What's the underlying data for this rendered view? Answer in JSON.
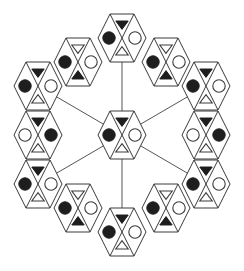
{
  "diagram": {
    "colors": {
      "line": "#3a3a3a",
      "filled": "#1e1e1e",
      "hollow_fill": "#ffffff",
      "background": "#ffffff"
    },
    "hex_size": {
      "half_width": 24,
      "half_top": 12,
      "half_height": 24
    },
    "center": {
      "id": "center",
      "cx": 122,
      "cy": 135,
      "top": "tri-down-filled",
      "left": "circle-filled",
      "right": "circle-hollow",
      "bottom": "tri-up-hollow"
    },
    "ring": [
      {
        "id": "top",
        "cx": 122,
        "cy": 38,
        "top": "tri-down-filled",
        "left": "circle-filled",
        "right": "circle-hollow",
        "bottom": "tri-up-hollow",
        "spoke": true
      },
      {
        "id": "upper-right-diag",
        "cx": 166,
        "cy": 62,
        "top": "tri-down-hollow",
        "left": "circle-filled",
        "right": "circle-hollow",
        "bottom": "tri-up-filled",
        "spoke": false
      },
      {
        "id": "right-upper",
        "cx": 206,
        "cy": 86,
        "top": "tri-down-filled",
        "left": "circle-filled",
        "right": "circle-hollow",
        "bottom": "tri-up-hollow",
        "spoke": true
      },
      {
        "id": "right-mid",
        "cx": 206,
        "cy": 135,
        "top": "tri-down-filled",
        "left": "circle-hollow",
        "right": "circle-filled",
        "bottom": "tri-up-hollow",
        "spoke": false
      },
      {
        "id": "right-lower",
        "cx": 206,
        "cy": 184,
        "top": "tri-down-filled",
        "left": "circle-filled",
        "right": "circle-hollow",
        "bottom": "tri-up-hollow",
        "spoke": true
      },
      {
        "id": "lower-right-diag",
        "cx": 166,
        "cy": 208,
        "top": "tri-down-hollow",
        "left": "circle-filled",
        "right": "circle-hollow",
        "bottom": "tri-up-filled",
        "spoke": false
      },
      {
        "id": "bottom",
        "cx": 122,
        "cy": 232,
        "top": "tri-down-filled",
        "left": "circle-filled",
        "right": "circle-hollow",
        "bottom": "tri-up-hollow",
        "spoke": true
      },
      {
        "id": "lower-left-diag",
        "cx": 78,
        "cy": 208,
        "top": "tri-down-hollow",
        "left": "circle-filled",
        "right": "circle-hollow",
        "bottom": "tri-up-filled",
        "spoke": false
      },
      {
        "id": "left-lower",
        "cx": 38,
        "cy": 184,
        "top": "tri-down-filled",
        "left": "circle-filled",
        "right": "circle-hollow",
        "bottom": "tri-up-hollow",
        "spoke": true
      },
      {
        "id": "left-mid",
        "cx": 38,
        "cy": 135,
        "top": "tri-down-filled",
        "left": "circle-hollow",
        "right": "circle-filled",
        "bottom": "tri-up-hollow",
        "spoke": false
      },
      {
        "id": "left-upper",
        "cx": 38,
        "cy": 86,
        "top": "tri-down-filled",
        "left": "circle-filled",
        "right": "circle-hollow",
        "bottom": "tri-up-hollow",
        "spoke": true
      },
      {
        "id": "upper-left-diag",
        "cx": 78,
        "cy": 62,
        "top": "tri-down-hollow",
        "left": "circle-filled",
        "right": "circle-hollow",
        "bottom": "tri-up-filled",
        "spoke": false
      }
    ],
    "spokes": [
      {
        "from": "center",
        "to": "top"
      },
      {
        "from": "center",
        "to": "right-upper"
      },
      {
        "from": "center",
        "to": "right-lower"
      },
      {
        "from": "center",
        "to": "bottom"
      },
      {
        "from": "center",
        "to": "left-lower"
      },
      {
        "from": "center",
        "to": "left-upper"
      }
    ]
  }
}
